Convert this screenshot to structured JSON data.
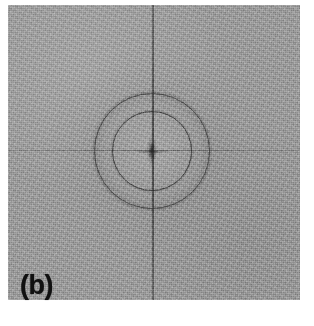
{
  "figure": {
    "panel_label": "(b)",
    "image_type": "diffractogram",
    "alt_description": "Grayscale electron diffraction pattern / Fourier transform with two concentric dark rings and a vertical streak"
  },
  "colors": {
    "page_background": "#ffffff",
    "plate_background": "#9d9d9d",
    "ring_color": "#2d2d2d",
    "streak_color": "#373737",
    "label_color": "#101010"
  },
  "chart_data": {
    "type": "heatmap",
    "title": "",
    "subtitle": "",
    "xlabel": "",
    "ylabel": "",
    "legend": [],
    "annotations": [
      "(b)"
    ],
    "grid": false,
    "plate": {
      "x": 8,
      "y": 5,
      "width": 292,
      "height": 295,
      "background_gray": 157,
      "noise": "fine speckle"
    },
    "pattern_center": {
      "x": 152,
      "y": 151
    },
    "rings": [
      {
        "name": "inner-ring",
        "radius_px": 40,
        "intensity": "dark",
        "line_width_px": 1.4
      },
      {
        "name": "outer-ring",
        "radius_px": 58,
        "intensity": "dark",
        "line_width_px": 1.4
      }
    ],
    "annulus": {
      "inner_radius_px": 40,
      "outer_radius_px": 58,
      "shading": "slightly darker than background"
    },
    "streaks": [
      {
        "name": "vertical-streak",
        "orientation": "vertical",
        "position_px": 152,
        "span": "full-height",
        "intensity": "dark"
      },
      {
        "name": "horizontal-streak",
        "orientation": "horizontal",
        "position_px": 151,
        "span": "full-width",
        "intensity": "faint"
      }
    ],
    "center_artifact": {
      "name": "center-star",
      "shape": "cross",
      "intensity": "dark",
      "height_px": 32,
      "width_px": 36
    }
  }
}
